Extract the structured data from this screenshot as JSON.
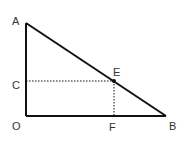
{
  "figure": {
    "type": "geometry",
    "points": {
      "A": {
        "label": "A",
        "x": 26,
        "y": 23
      },
      "O": {
        "label": "O",
        "x": 26,
        "y": 116
      },
      "B": {
        "label": "B",
        "x": 166,
        "y": 116
      },
      "E": {
        "label": "E",
        "x": 114,
        "y": 81
      },
      "C": {
        "label": "C",
        "x": 26,
        "y": 81
      },
      "F": {
        "label": "F",
        "x": 114,
        "y": 116
      }
    },
    "solid_segments": [
      "AO",
      "OB",
      "AB"
    ],
    "dotted_segments": [
      "CE",
      "EF"
    ],
    "colors": {
      "line": "#111111",
      "label": "#333333"
    }
  }
}
